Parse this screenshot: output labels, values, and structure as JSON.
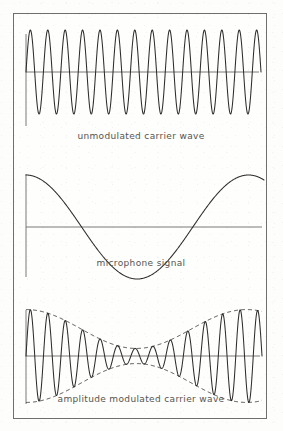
{
  "figure": {
    "background_color": "#fdfdfc",
    "frame_color": "#6f6f6b",
    "axis_color": "#6d6c68",
    "wave_color": "#2e2d2b",
    "envelope_color": "#3a3937",
    "caption_color": "#55544f"
  },
  "panels": [
    {
      "id": "carrier",
      "caption": "unmodulated carrier wave",
      "plot": {
        "width": 254,
        "height": 140,
        "origin_x": 12,
        "baseline_y": 58,
        "axis_x_end": 245,
        "axis_y_top": 20,
        "axis_y_bottom": 112
      }
    },
    {
      "id": "signal",
      "caption": "microphone signal",
      "plot": {
        "width": 254,
        "height": 140,
        "origin_x": 12,
        "baseline_y": 73,
        "axis_x_end": 248,
        "axis_y_top": 20,
        "axis_y_bottom": 123
      }
    },
    {
      "id": "am",
      "caption": "amplitude modulated carrier wave",
      "plot": {
        "width": 254,
        "height": 126,
        "origin_x": 12,
        "baseline_y": 62,
        "axis_x_end": 246,
        "axis_y_top": 16,
        "axis_y_bottom": 110
      }
    }
  ],
  "chart_data": [
    {
      "type": "line",
      "id": "carrier-wave",
      "title": "unmodulated carrier wave",
      "xlabel": "time",
      "ylabel": "amplitude",
      "grid": false,
      "legend": "none",
      "waveform": "sine",
      "cycles": 13.5,
      "amplitude": 42,
      "phase_deg": 0,
      "x_start": 12,
      "x_end": 247,
      "samples": 900,
      "xlim": [
        0,
        13.5
      ],
      "ylim": [
        -1,
        1
      ]
    },
    {
      "type": "line",
      "id": "microphone-signal",
      "title": "microphone signal",
      "xlabel": "time",
      "ylabel": "amplitude",
      "grid": false,
      "legend": "none",
      "waveform": "cosine",
      "cycles": 1.07,
      "amplitude": 52,
      "phase_deg": 0,
      "x_start": 12,
      "x_end": 250,
      "samples": 600,
      "xlim": [
        0,
        1.07
      ],
      "ylim": [
        -1,
        1
      ]
    },
    {
      "type": "line",
      "id": "amplitude-modulated-wave",
      "title": "amplitude modulated carrier wave",
      "xlabel": "time",
      "ylabel": "amplitude",
      "grid": false,
      "legend": "none",
      "waveform": "am",
      "carrier_cycles": 13.5,
      "modulation_cycles": 1.07,
      "modulation_index": 0.72,
      "carrier_amplitude": 27,
      "amplitude": 46,
      "phase_deg": 0,
      "x_start": 12,
      "x_end": 248,
      "samples": 1400,
      "envelope": "dashed",
      "xlim": [
        0,
        13.5
      ],
      "ylim": [
        -1,
        1
      ]
    }
  ]
}
